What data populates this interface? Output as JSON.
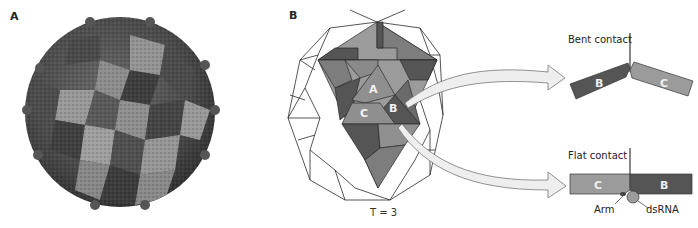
{
  "panels": {
    "a": {
      "label": "A",
      "description": "Surface rendering of icosahedral virus capsid, subunits shaded in three gray tones"
    },
    "b": {
      "label": "B",
      "lattice_label": "T = 3",
      "subunits": [
        "A",
        "B",
        "C"
      ],
      "bent_contact": {
        "title": "Bent contact",
        "left": "B",
        "right": "C"
      },
      "flat_contact": {
        "title": "Flat contact",
        "left": "C",
        "right": "B",
        "arm_label": "Arm",
        "rna_label": "dsRNA"
      }
    }
  },
  "colors": {
    "light_subunit": "#9b9b9b",
    "mid_subunit": "#7d7d7d",
    "dark_subunit": "#555555",
    "outline": "#2a2a2a",
    "arrow_fill": "#eeeeee",
    "arrow_stroke": "#777777"
  }
}
